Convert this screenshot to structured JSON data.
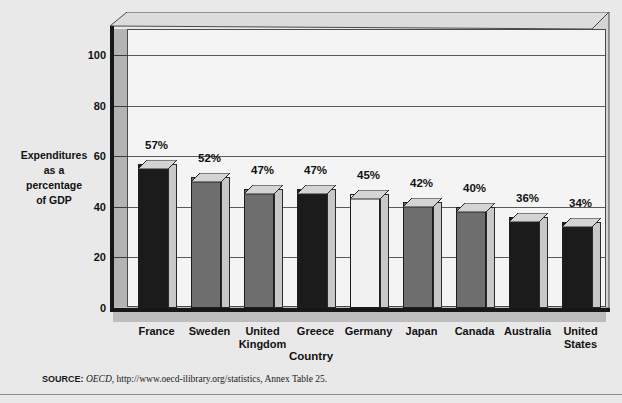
{
  "figure": {
    "background_color": "#e9e9e9"
  },
  "axis_titles": {
    "y": "Expenditures\nas a\npercentage\nof GDP",
    "y_lines": [
      "Expenditures",
      "as a",
      "percentage",
      "of GDP"
    ],
    "x": "Country"
  },
  "source": {
    "label": "SOURCE:",
    "italic_part": "OECD",
    "rest": ", http://www.oecd-ilibrary.org/statistics, Annex Table 25."
  },
  "chart_data": {
    "type": "bar",
    "title": "",
    "subtitle": "",
    "xlabel": "Country",
    "ylabel": "Expenditures as a percentage of GDP",
    "categories": [
      "France",
      "Sweden",
      "United Kingdom",
      "Greece",
      "Germany",
      "Japan",
      "Canada",
      "Australia",
      "United States"
    ],
    "category_lines": [
      [
        "France"
      ],
      [
        "Sweden"
      ],
      [
        "United",
        "Kingdom"
      ],
      [
        "Greece"
      ],
      [
        "Germany"
      ],
      [
        "Japan"
      ],
      [
        "Canada"
      ],
      [
        "Australia"
      ],
      [
        "United",
        "States"
      ]
    ],
    "values": [
      57,
      52,
      47,
      47,
      45,
      42,
      40,
      36,
      34
    ],
    "data_labels": [
      "57%",
      "52%",
      "47%",
      "47%",
      "45%",
      "42%",
      "40%",
      "36%",
      "34%"
    ],
    "bar_colors": [
      "#1b1b1b",
      "#6e6e6e",
      "#6e6e6e",
      "#1b1b1b",
      "#f1f1f1",
      "#6e6e6e",
      "#6e6e6e",
      "#1b1b1b",
      "#1b1b1b"
    ],
    "ylim": [
      0,
      110
    ],
    "yticks": [
      0,
      20,
      40,
      60,
      80,
      100
    ],
    "ytick_labels": [
      "0",
      "20",
      "40",
      "60",
      "80",
      "100"
    ],
    "grid": true,
    "legend": "none",
    "units": "percent",
    "three_d": true
  }
}
